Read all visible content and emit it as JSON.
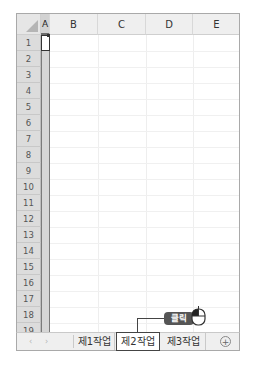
{
  "spreadsheet": {
    "columns": [
      "A",
      "B",
      "C",
      "D",
      "E"
    ],
    "rows": [
      "1",
      "2",
      "3",
      "4",
      "5",
      "6",
      "7",
      "8",
      "9",
      "10",
      "11",
      "12",
      "13",
      "14",
      "15",
      "16",
      "17",
      "18",
      "19"
    ],
    "selected_column": "A",
    "active_cell": "A1"
  },
  "sheet_tabs": {
    "nav_prev": "‹",
    "nav_next": "›",
    "tabs": [
      {
        "label": "제1작업",
        "active": false
      },
      {
        "label": "제2작업",
        "active": true
      },
      {
        "label": "제3작업",
        "active": false
      }
    ],
    "add_sheet": "+"
  },
  "annotation": {
    "label": "클릭",
    "target": "제2작업"
  },
  "colors": {
    "selection_border": "#444444",
    "callout_bg": "#555555"
  }
}
